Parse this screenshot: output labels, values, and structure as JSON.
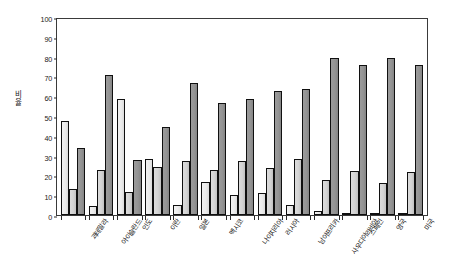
{
  "chart_data": {
    "type": "bar",
    "title": "",
    "xlabel": "",
    "ylabel": "비율",
    "ylim": [
      0,
      100
    ],
    "yticks": [
      0,
      10,
      20,
      30,
      40,
      50,
      60,
      70,
      80,
      90,
      100
    ],
    "grid": false,
    "legend": "none",
    "categories": [
      "과테말라",
      "아이슬란드",
      "인도",
      "이란",
      "일본",
      "멕시코",
      "나이지리아",
      "러시아",
      "남아프리카",
      "사우디아라비아",
      "스페인",
      "영국",
      "미국"
    ],
    "series": [
      {
        "name": "series-1",
        "values": [
          47.5,
          4.5,
          58.5,
          28.5,
          5.0,
          16.5,
          10.0,
          11.0,
          5.0,
          2.0,
          1.0,
          0.8,
          0.8
        ]
      },
      {
        "name": "series-2",
        "values": [
          13.0,
          22.5,
          11.5,
          24.0,
          27.5,
          22.5,
          27.5,
          23.5,
          28.5,
          17.5,
          22.0,
          16.0,
          21.5
        ]
      },
      {
        "name": "series-3",
        "values": [
          34.0,
          70.5,
          28.0,
          44.5,
          66.5,
          56.5,
          58.5,
          62.5,
          63.5,
          79.5,
          76.0,
          79.5,
          76.0
        ]
      }
    ]
  }
}
